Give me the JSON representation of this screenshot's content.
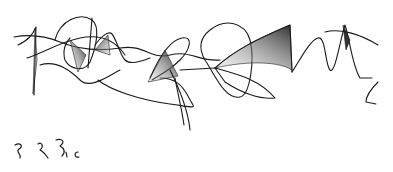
{
  "image": {
    "description": "Abstract pen scribble drawing with shaded lobes and curves",
    "background": "#ffffff",
    "ink_color": "#1a1a1a",
    "annotation_marks": "illegible handwritten squiggles"
  }
}
